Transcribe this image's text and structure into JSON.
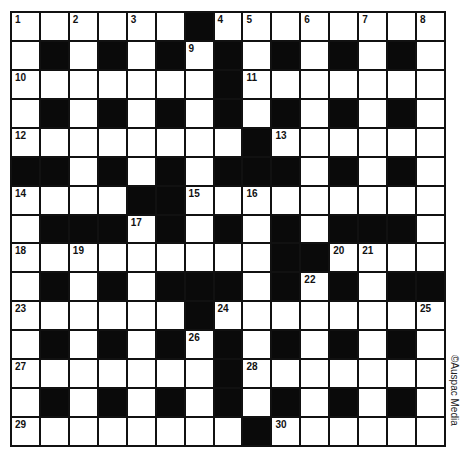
{
  "puzzle": {
    "rows": 15,
    "cols": 15,
    "layout": [
      "......#........",
      ".#.#.#.#.#.#.#.",
      ".......#.......",
      ".#.#.#.#.#.#.#.",
      "........#......",
      "##.#.#.###.#.#.",
      "....##.........",
      ".###.#.#.#.###.",
      ".........##....",
      ".#.#.###.#.#.##",
      "......#........",
      ".#.#.#.#.#.#.#.",
      ".......#.......",
      ".#.#.#.#.#.#.#.",
      "........#......"
    ],
    "numbers": [
      {
        "n": "1",
        "r": 0,
        "c": 0
      },
      {
        "n": "2",
        "r": 0,
        "c": 2
      },
      {
        "n": "3",
        "r": 0,
        "c": 4
      },
      {
        "n": "4",
        "r": 0,
        "c": 7
      },
      {
        "n": "5",
        "r": 0,
        "c": 8
      },
      {
        "n": "6",
        "r": 0,
        "c": 10
      },
      {
        "n": "7",
        "r": 0,
        "c": 12
      },
      {
        "n": "8",
        "r": 0,
        "c": 14
      },
      {
        "n": "9",
        "r": 1,
        "c": 6
      },
      {
        "n": "10",
        "r": 2,
        "c": 0
      },
      {
        "n": "11",
        "r": 2,
        "c": 8
      },
      {
        "n": "12",
        "r": 4,
        "c": 0
      },
      {
        "n": "13",
        "r": 4,
        "c": 9
      },
      {
        "n": "14",
        "r": 6,
        "c": 0
      },
      {
        "n": "15",
        "r": 6,
        "c": 6
      },
      {
        "n": "16",
        "r": 6,
        "c": 8
      },
      {
        "n": "17",
        "r": 7,
        "c": 4
      },
      {
        "n": "18",
        "r": 8,
        "c": 0
      },
      {
        "n": "19",
        "r": 8,
        "c": 2
      },
      {
        "n": "20",
        "r": 8,
        "c": 11
      },
      {
        "n": "21",
        "r": 8,
        "c": 12
      },
      {
        "n": "22",
        "r": 9,
        "c": 10
      },
      {
        "n": "23",
        "r": 10,
        "c": 0
      },
      {
        "n": "24",
        "r": 10,
        "c": 7
      },
      {
        "n": "25",
        "r": 10,
        "c": 14
      },
      {
        "n": "26",
        "r": 11,
        "c": 6
      },
      {
        "n": "27",
        "r": 12,
        "c": 0
      },
      {
        "n": "28",
        "r": 12,
        "c": 8
      },
      {
        "n": "29",
        "r": 14,
        "c": 0
      },
      {
        "n": "30",
        "r": 14,
        "c": 9
      }
    ]
  },
  "copyright": "©Auspac Media",
  "colors": {
    "block": "#0a0a0a",
    "cell": "#ffffff",
    "line": "#111111"
  }
}
